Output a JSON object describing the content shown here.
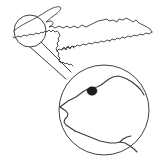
{
  "figure": {
    "title": "Locator map with circular inset",
    "description": "Line-art outline map of a lake-shore peninsula region with a small highlight circle connected by two leader lines to an enlarged circular inset showing a detailed shoreline and a filled dot site marker.",
    "background_color": "#ffffff",
    "line_color": "#3a3a3a",
    "marker_color": "#1c1c1c"
  },
  "overview_map": {
    "name": "regional-outline",
    "label": "",
    "stroke_color": "#3a3a3a",
    "stroke_width": 0.9
  },
  "highlight_circle": {
    "name": "highlight-circle",
    "label": "",
    "center_x": 30,
    "center_y": 31,
    "radius": 16,
    "stroke_color": "#3f3f3f",
    "stroke_width": 1.0
  },
  "leader_lines": {
    "name": "leader-lines",
    "count": 2,
    "stroke_color": "#3f3f3f",
    "stroke_width": 1.0,
    "upper": {
      "x1": 41,
      "y1": 42,
      "x2": 71,
      "y2": 72
    },
    "lower": {
      "x1": 30,
      "y1": 47,
      "x2": 66,
      "y2": 79
    }
  },
  "inset_circle": {
    "name": "inset-circle",
    "label": "",
    "center_x": 104,
    "center_y": 110,
    "radius": 45,
    "stroke_color": "#3f3f3f",
    "stroke_width": 1.0
  },
  "site_marker": {
    "name": "site-marker",
    "label": "",
    "center_x": 92,
    "center_y": 91,
    "radius_x": 5,
    "radius_y": 4.2,
    "fill_color": "#1c1c1c"
  },
  "annotations": {
    "scale_bar": "",
    "north_arrow": "",
    "caption": ""
  }
}
